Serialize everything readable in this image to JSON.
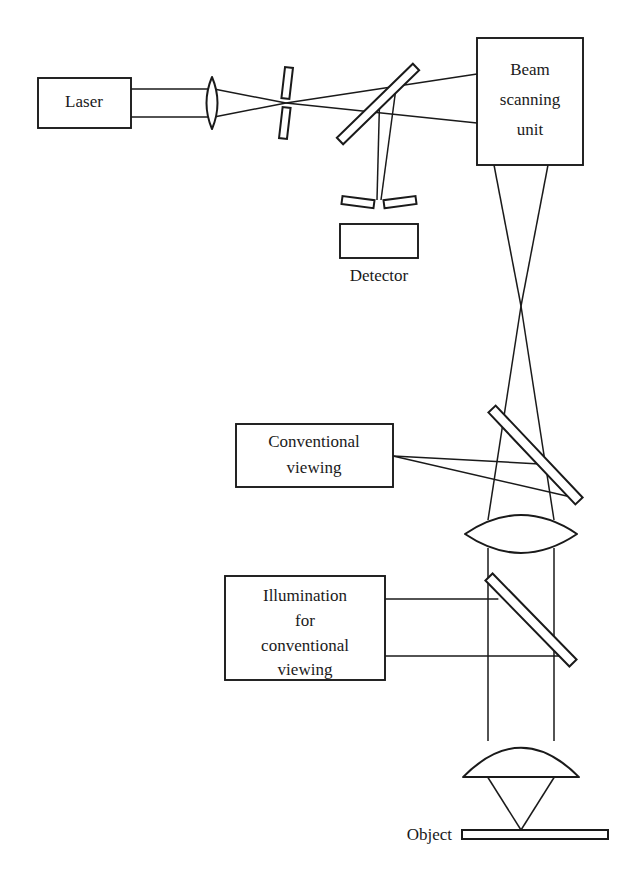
{
  "figure": {
    "kind": "optical-ray-diagram",
    "background_color": "#ffffff",
    "line_color": "#1a1a1a",
    "width": 626,
    "height": 884
  },
  "components": {
    "laser": {
      "label": "Laser",
      "label_x": 84,
      "label_y": 103,
      "box": {
        "x": 38,
        "y": 78,
        "w": 93,
        "h": 50
      }
    },
    "beam_scanning_unit": {
      "label_lines": [
        "Beam",
        "scanning",
        "unit"
      ],
      "line1": "Beam",
      "line2": "scanning",
      "line3": "unit",
      "label_x": 530,
      "label_y1": 71,
      "label_y2": 101,
      "label_y3": 131,
      "box": {
        "x": 477,
        "y": 38,
        "w": 106,
        "h": 127
      }
    },
    "detector": {
      "label": "Detector",
      "label_x": 379,
      "label_y": 277,
      "box": {
        "x": 340,
        "y": 224,
        "w": 78,
        "h": 34
      }
    },
    "conventional_viewing": {
      "label_lines": [
        "Conventional",
        "viewing"
      ],
      "line1": "Conventional",
      "line2": "viewing",
      "label_x": 314,
      "label_y1": 443,
      "label_y2": 469,
      "box": {
        "x": 236,
        "y": 424,
        "w": 157,
        "h": 63
      }
    },
    "illumination_for_conventional_viewing": {
      "label_lines": [
        "Illumination",
        "for",
        "conventional",
        "viewing"
      ],
      "line1": "Illumination",
      "line2": "for",
      "line3": "conventional",
      "line4": "viewing",
      "label_x": 305,
      "label_y1": 597,
      "label_y2": 622,
      "label_y3": 647,
      "label_y4": 671,
      "box": {
        "x": 225,
        "y": 576,
        "w": 160,
        "h": 104
      }
    },
    "object": {
      "label": "Object",
      "label_x": 452,
      "label_y": 836,
      "slide": {
        "x": 462,
        "y": 830,
        "w": 146,
        "h": 9
      }
    },
    "collimating_lens": {
      "cx": 212,
      "cy": 103,
      "rx": 11,
      "ry": 26
    },
    "pinhole_source": {
      "cx": 286,
      "cy": 103,
      "gap": 9,
      "bar_h": 31,
      "bar_w": 8
    },
    "beamsplitter_detector": {
      "x1": 340,
      "y1": 141,
      "x2": 416,
      "y2": 67,
      "thickness": 9
    },
    "pinhole_detector": {
      "cx": 379,
      "cy": 203,
      "gap": 10,
      "bar_w": 32,
      "bar_h": 8
    },
    "mirror_conventional_viewing": {
      "x1": 492,
      "y1": 409,
      "x2": 579,
      "y2": 501,
      "thickness": 10
    },
    "tube_lens": {
      "cx": 521,
      "cy": 534,
      "rx": 56,
      "ry": 18
    },
    "beamsplitter_illumination": {
      "x1": 489,
      "y1": 577,
      "x2": 573,
      "y2": 663,
      "thickness": 10
    },
    "objective_lens": {
      "cx": 521,
      "cy": 762,
      "rx": 58,
      "ry": 29
    }
  },
  "beams": {
    "laser_to_lens_top_y": 89,
    "laser_to_lens_bottom_y": 117,
    "focus_x": 286,
    "focus_y": 103,
    "scan_entry_top_y": 74,
    "scan_entry_bottom_y": 123,
    "scan_exit_left_x": 494,
    "scan_exit_right_x": 548,
    "crossover_x": 521,
    "crossover_y": 306,
    "detector_focus_x": 379,
    "detector_focus_y": 200,
    "conventional_port_y": 456,
    "illumination_port_top_y": 599,
    "illumination_port_bottom_y": 656,
    "object_focus_x": 521,
    "object_focus_y": 830
  },
  "annotations": {
    "description": "Laser beam is expanded, spatially filtered through a pinhole, reflected by a beamsplitter into the beam scanning unit, then focused through the tube lens and objective onto the object. Returning light passes back through the beamsplitter to a confocal detector pinhole and detector. Separate ports provide conventional viewing and illumination for conventional viewing."
  }
}
